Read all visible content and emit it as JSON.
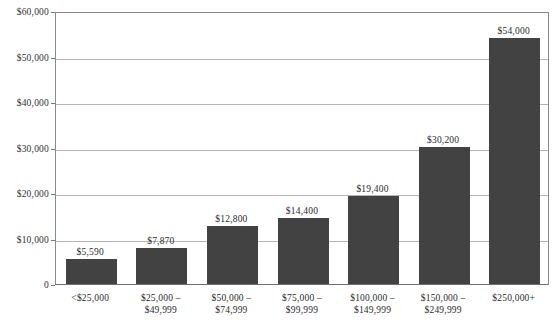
{
  "chart_data": {
    "type": "bar",
    "title": "",
    "subtitle": "",
    "xlabel": "",
    "ylabel": "",
    "categories": [
      "<$25,000",
      "$25,000 –\n$49,999",
      "$50,000 –\n$74,999",
      "$75,000 –\n$99,999",
      "$100,000 –\n$149,999",
      "$150,000 –\n$249,999",
      "$250,000+"
    ],
    "values": [
      5590,
      7870,
      12800,
      14400,
      19400,
      30200,
      54000
    ],
    "value_labels": [
      "$5,590",
      "$7,870",
      "$12,800",
      "$14,400",
      "$19,400",
      "$30,200",
      "$54,000"
    ],
    "ylim": [
      0,
      60000
    ],
    "yticks": [
      0,
      10000,
      20000,
      30000,
      40000,
      50000,
      60000
    ],
    "ytick_labels": [
      "0",
      "$10,000",
      "$20,000",
      "$30,000",
      "$40,000",
      "$50,000",
      "$60,000"
    ],
    "grid": true,
    "grid_axis": "y",
    "legend": "none",
    "bar_color": "#424242",
    "grid_color": "#b4b4b4",
    "axis_color": "#7a7a7a",
    "text_color": "#2b2b2b",
    "background": "#ffffff"
  }
}
